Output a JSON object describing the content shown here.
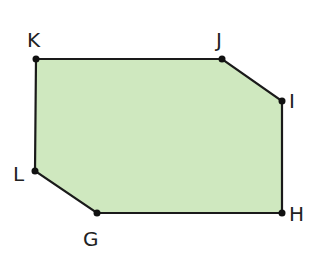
{
  "diagram": {
    "type": "polygon",
    "fill_color": "#cfe8bf",
    "stroke_color": "#1a1a1a",
    "vertices": [
      {
        "name": "K",
        "x": 36,
        "y": 59
      },
      {
        "name": "J",
        "x": 222,
        "y": 59
      },
      {
        "name": "I",
        "x": 282,
        "y": 101
      },
      {
        "name": "H",
        "x": 282,
        "y": 213
      },
      {
        "name": "G",
        "x": 97,
        "y": 213
      },
      {
        "name": "L",
        "x": 35,
        "y": 171
      }
    ],
    "labels": {
      "K": "K",
      "J": "J",
      "I": "I",
      "H": "H",
      "G": "G",
      "L": "L"
    }
  }
}
